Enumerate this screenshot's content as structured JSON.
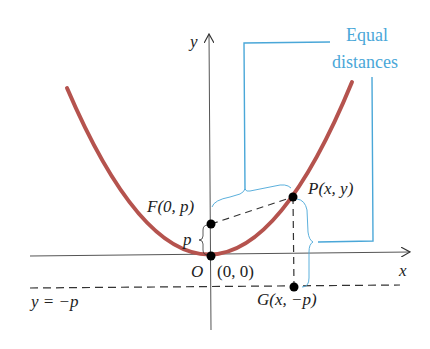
{
  "figure": {
    "type": "parabola-focus-directrix",
    "labels": {
      "y_axis": "y",
      "x_axis": "x",
      "focus": "F(0, p)",
      "point": "P(x, y)",
      "origin": "O",
      "origin_coords": "(0, 0)",
      "directrix_point": "G(x, −p)",
      "directrix_eq": "y = −p",
      "p_label": "p",
      "callout_line1": "Equal",
      "callout_line2": "distances"
    },
    "colors": {
      "curve": "#b5534e",
      "callout": "#4aa7d8",
      "axes": "#333333",
      "points": "#000000"
    }
  }
}
